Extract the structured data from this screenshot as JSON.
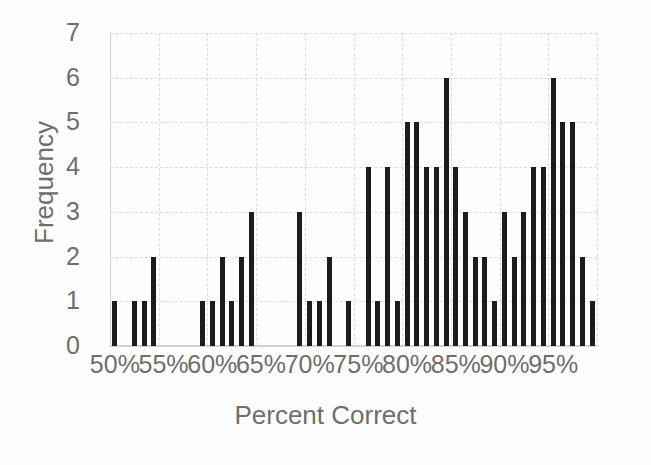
{
  "chart_data": {
    "type": "bar",
    "title": "",
    "subtitle": "",
    "xlabel": "Percent Correct",
    "ylabel": "Frequency",
    "xlim": [
      50,
      100
    ],
    "ylim": [
      0,
      7
    ],
    "y_ticks": [
      0,
      1,
      2,
      3,
      4,
      5,
      6,
      7
    ],
    "y_tick_labels": [
      "0",
      "1",
      "2",
      "3",
      "4",
      "5",
      "6",
      "7"
    ],
    "x_ticks": [
      50,
      55,
      60,
      65,
      70,
      75,
      80,
      85,
      90,
      95
    ],
    "x_tick_labels": [
      "50%",
      "55%",
      "60%",
      "65%",
      "70%",
      "75%",
      "80%",
      "85%",
      "90%",
      "95%"
    ],
    "grid": true,
    "grid_style": "dashed",
    "legend": false,
    "legend_position": "none",
    "bin_width": 1,
    "bar_color": "#1c1c1c",
    "grid_color": "#dcdcdc",
    "text_color": "#6e6e6e",
    "background_color": "#ffffff",
    "categories": [
      "50%",
      "51%",
      "52%",
      "53%",
      "54%",
      "55%",
      "56%",
      "57%",
      "58%",
      "59%",
      "60%",
      "61%",
      "62%",
      "63%",
      "64%",
      "65%",
      "66%",
      "67%",
      "68%",
      "69%",
      "70%",
      "71%",
      "72%",
      "73%",
      "74%",
      "75%",
      "76%",
      "77%",
      "78%",
      "79%",
      "80%",
      "81%",
      "82%",
      "83%",
      "84%",
      "85%",
      "86%",
      "87%",
      "88%",
      "89%",
      "90%",
      "91%",
      "92%",
      "93%",
      "94%",
      "95%",
      "96%",
      "97%",
      "98%",
      "99%"
    ],
    "x": [
      50,
      51,
      52,
      53,
      54,
      55,
      56,
      57,
      58,
      59,
      60,
      61,
      62,
      63,
      64,
      65,
      66,
      67,
      68,
      69,
      70,
      71,
      72,
      73,
      74,
      75,
      76,
      77,
      78,
      79,
      80,
      81,
      82,
      83,
      84,
      85,
      86,
      87,
      88,
      89,
      90,
      91,
      92,
      93,
      94,
      95,
      96,
      97,
      98,
      99
    ],
    "values": [
      1,
      0,
      1,
      1,
      2,
      0,
      0,
      0,
      0,
      1,
      1,
      2,
      1,
      2,
      3,
      0,
      0,
      0,
      0,
      3,
      1,
      1,
      2,
      0,
      1,
      0,
      4,
      1,
      4,
      1,
      5,
      5,
      4,
      4,
      6,
      4,
      3,
      2,
      2,
      1,
      3,
      2,
      3,
      4,
      4,
      6,
      5,
      5,
      2,
      1
    ]
  },
  "axes": {
    "y_title": "Frequency",
    "x_title": "Percent Correct"
  }
}
